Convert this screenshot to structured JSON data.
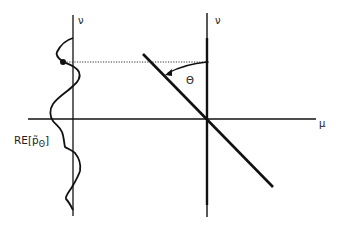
{
  "diagram": {
    "left_axis_label": "ν",
    "right_axis_label": "ν",
    "horizontal_axis_label": "μ",
    "angle_label": "Θ",
    "curve_label": {
      "prefix": "RE[",
      "symbol": "p̃",
      "subscript": "Θ",
      "suffix": "]"
    },
    "colors": {
      "stroke": "#111111",
      "background": "#ffffff"
    }
  }
}
